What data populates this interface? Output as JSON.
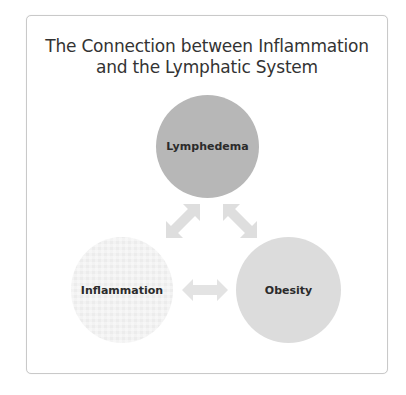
{
  "diagram": {
    "title_line1": "The Connection between Inflammation",
    "title_line2": "and the Lymphatic System",
    "nodes": [
      {
        "id": "lymphedema",
        "label": "Lymphedema",
        "color": "#b7b7b7"
      },
      {
        "id": "inflammation",
        "label": "Inflammation",
        "color": "#ececec"
      },
      {
        "id": "obesity",
        "label": "Obesity",
        "color": "#dcdcdc"
      }
    ],
    "edges": [
      {
        "from": "lymphedema",
        "to": "inflammation",
        "type": "bidirectional-arrow"
      },
      {
        "from": "lymphedema",
        "to": "obesity",
        "type": "bidirectional-arrow"
      },
      {
        "from": "inflammation",
        "to": "obesity",
        "type": "bidirectional-arrow"
      }
    ],
    "arrow_color": "#dedede",
    "frame_border_color": "#c9c9c9"
  }
}
